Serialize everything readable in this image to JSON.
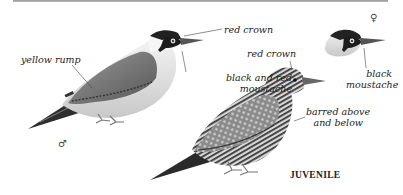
{
  "figure": {
    "colors": {
      "background": "#ffffff",
      "ink": "#222222",
      "rule": "#a8a8a8"
    },
    "male": {
      "sex_symbol": "♂",
      "labels": {
        "rump": "yellow rump",
        "crown": "red crown",
        "moustache_line1": "black and red",
        "moustache_line2": "moustache"
      }
    },
    "female": {
      "sex_symbol": "♀",
      "labels": {
        "moustache_line1": "black",
        "moustache_line2": "moustache"
      }
    },
    "juvenile": {
      "caption": "JUVENILE",
      "labels": {
        "crown": "red crown",
        "barring_line1": "barred above",
        "barring_line2": "and below"
      }
    }
  }
}
